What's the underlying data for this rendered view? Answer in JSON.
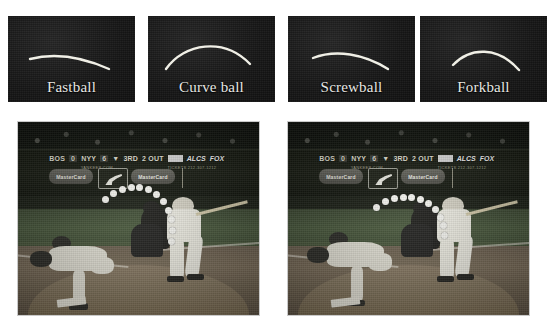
{
  "figure": {
    "background_color": "#ffffff"
  },
  "pitch_diagrams": {
    "panel_background": "#191919",
    "trajectory_color": "#f0efe6",
    "label_color": "#e8e8e4",
    "panels": [
      {
        "label": "Fastball",
        "icon": "trajectory-curve-icon",
        "path": "M 22 43 C 45 37, 72 40, 101 53"
      },
      {
        "label": "Curve ball",
        "icon": "trajectory-curve-icon",
        "path": "M 18 53 C 36 27, 76 21, 102 48"
      },
      {
        "label": "Screwball",
        "icon": "trajectory-curve-icon",
        "path": "M 25 42 C 48 33, 76 38, 100 53"
      },
      {
        "label": "Forkball",
        "icon": "trajectory-curve-icon",
        "path": "M 33 49 C 50 31, 78 30, 99 54"
      }
    ]
  },
  "photos": [
    {
      "name": "broadcast-frame-left",
      "scoreboard": {
        "away_team": "BOS",
        "away_score": "0",
        "home_team": "NYY",
        "home_score": "6",
        "inning_arrow": "▼",
        "inning": "3RD",
        "outs": "2 OUT",
        "count_box": "",
        "series": "ALCS",
        "network": "FOX",
        "sub_text": "YANKEES.COM",
        "sub_text_right": "TICKETS 212-307-1212"
      },
      "advertisements": [
        {
          "text": "MasterCard"
        },
        {
          "text": "MasterCard"
        }
      ],
      "logo_icon": "mlb-batter-logo-icon",
      "trajectory_dots": [
        [
          88,
          78
        ],
        [
          96,
          72
        ],
        [
          105,
          68
        ],
        [
          114,
          66
        ],
        [
          123,
          66
        ],
        [
          132,
          68
        ],
        [
          140,
          73
        ],
        [
          147,
          80
        ],
        [
          152,
          89
        ],
        [
          155,
          99
        ],
        [
          156,
          110
        ],
        [
          155,
          121
        ]
      ]
    },
    {
      "name": "broadcast-frame-right",
      "scoreboard": {
        "away_team": "BOS",
        "away_score": "0",
        "home_team": "NYY",
        "home_score": "6",
        "inning_arrow": "▼",
        "inning": "3RD",
        "outs": "2 OUT",
        "count_box": "",
        "series": "ALCS",
        "network": "FOX",
        "sub_text": "YANKEES.COM",
        "sub_text_right": "TICKETS 212-307-1212"
      },
      "advertisements": [
        {
          "text": "MasterCard"
        },
        {
          "text": "MasterCard"
        }
      ],
      "logo_icon": "mlb-batter-logo-icon",
      "trajectory_dots": [
        [
          89,
          86
        ],
        [
          98,
          80
        ],
        [
          107,
          77
        ],
        [
          116,
          76
        ],
        [
          125,
          76
        ],
        [
          134,
          78
        ],
        [
          142,
          82
        ],
        [
          149,
          88
        ],
        [
          154,
          96
        ],
        [
          157,
          105
        ],
        [
          158,
          115
        ]
      ]
    }
  ]
}
